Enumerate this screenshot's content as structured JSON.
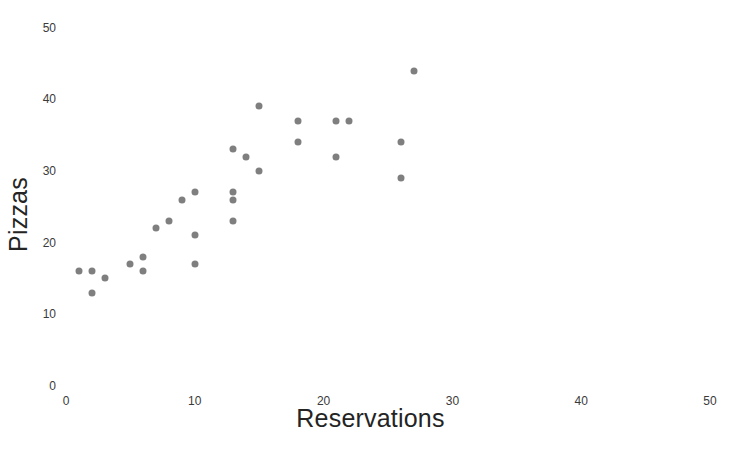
{
  "chart_data": {
    "type": "scatter",
    "title": "",
    "xlabel": "Reservations",
    "ylabel": "Pizzas",
    "xlim": [
      0,
      50
    ],
    "ylim": [
      0,
      50
    ],
    "xticks": [
      0,
      10,
      20,
      30,
      40,
      50
    ],
    "yticks": [
      0,
      10,
      20,
      30,
      40,
      50
    ],
    "xtick_labels": [
      "0",
      "10",
      "20",
      "30",
      "40",
      "50"
    ],
    "ytick_labels": [
      "0",
      "10",
      "20",
      "30",
      "40",
      "50"
    ],
    "grid": false,
    "legend": null,
    "marker_color": "#7f7f7f",
    "marker_size": 7,
    "background_color": "#ffffff",
    "series": [
      {
        "name": "Pizzas vs Reservations",
        "points": [
          {
            "x": 1,
            "y": 16
          },
          {
            "x": 2,
            "y": 16
          },
          {
            "x": 2,
            "y": 13
          },
          {
            "x": 3,
            "y": 15
          },
          {
            "x": 5,
            "y": 17
          },
          {
            "x": 6,
            "y": 18
          },
          {
            "x": 6,
            "y": 16
          },
          {
            "x": 7,
            "y": 22
          },
          {
            "x": 8,
            "y": 23
          },
          {
            "x": 9,
            "y": 26
          },
          {
            "x": 10,
            "y": 27
          },
          {
            "x": 10,
            "y": 21
          },
          {
            "x": 10,
            "y": 17
          },
          {
            "x": 13,
            "y": 33
          },
          {
            "x": 13,
            "y": 27
          },
          {
            "x": 13,
            "y": 26
          },
          {
            "x": 13,
            "y": 23
          },
          {
            "x": 14,
            "y": 32
          },
          {
            "x": 15,
            "y": 39
          },
          {
            "x": 15,
            "y": 30
          },
          {
            "x": 18,
            "y": 37
          },
          {
            "x": 18,
            "y": 34
          },
          {
            "x": 21,
            "y": 37
          },
          {
            "x": 21,
            "y": 32
          },
          {
            "x": 22,
            "y": 37
          },
          {
            "x": 26,
            "y": 34
          },
          {
            "x": 26,
            "y": 29
          },
          {
            "x": 27,
            "y": 44
          }
        ]
      }
    ]
  }
}
